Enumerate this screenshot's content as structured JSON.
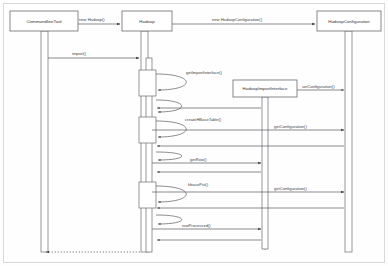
{
  "diagram": {
    "type": "uml-sequence-diagram",
    "canvas": {
      "width": 388,
      "height": 266,
      "background": "#fefefe"
    },
    "stroke_color": "#55555a",
    "text_color": "#3a3a3a"
  },
  "participants": [
    {
      "id": "cli",
      "label": "CommandlineTool",
      "box": {
        "x": 10,
        "y": 11,
        "w": 68,
        "h": 20
      },
      "lifeline_x": 44,
      "lifeline_bottom": 252
    },
    {
      "id": "hadoop",
      "label": "Hadoop",
      "box": {
        "x": 122,
        "y": 11,
        "w": 50,
        "h": 20
      },
      "lifeline_x": 147,
      "lifeline_bottom": 252
    },
    {
      "id": "hconf",
      "label": "HadoopConfiguration",
      "box": {
        "x": 317,
        "y": 11,
        "w": 64,
        "h": 20
      },
      "lifeline_x": 349,
      "lifeline_bottom": 252
    },
    {
      "id": "himport",
      "label": "HadoopImportInterface",
      "box": {
        "x": 233,
        "y": 80,
        "w": 64,
        "h": 17
      },
      "lifeline_x": 265,
      "lifeline_bottom": 252
    }
  ],
  "messages": [
    {
      "id": "m1",
      "label": "new Hadoop()",
      "from": "cli",
      "to": "hadoop",
      "y": 24,
      "kind": "create"
    },
    {
      "id": "m2",
      "label": "new HadoopConfiguration()",
      "from": "hadoop",
      "to": "hconf",
      "y": 24,
      "kind": "create"
    },
    {
      "id": "m3",
      "label": "import()",
      "from": "cli",
      "to": "hadoop",
      "y": 58,
      "kind": "call"
    },
    {
      "id": "m4",
      "label": "getImportInterface()",
      "from": "hadoop",
      "to": "hadoop",
      "y": 75,
      "kind": "self"
    },
    {
      "id": "m5",
      "label": "setConfiguration()",
      "from": "himport",
      "to": "hconf",
      "y": 90,
      "kind": "call"
    },
    {
      "id": "m6",
      "label": "createHBaseTable()",
      "from": "hadoop",
      "to": "hadoop",
      "y": 122,
      "kind": "self"
    },
    {
      "id": "m7",
      "label": "getConfiguration()",
      "from": "hadoop",
      "to": "hconf",
      "y": 130,
      "kind": "call"
    },
    {
      "id": "m8",
      "label": "getRow()",
      "from": "hadoop",
      "to": "himport",
      "y": 163,
      "kind": "call"
    },
    {
      "id": "m9",
      "label": "hbasePut()",
      "from": "hadoop",
      "to": "hadoop",
      "y": 187,
      "kind": "self"
    },
    {
      "id": "m10",
      "label": "getConfiguration()",
      "from": "hadoop",
      "to": "hconf",
      "y": 192,
      "kind": "call"
    },
    {
      "id": "m11",
      "label": "rowProcessed()",
      "from": "hadoop",
      "to": "himport",
      "y": 229,
      "kind": "call"
    },
    {
      "id": "m12",
      "label": "",
      "from": "hadoop",
      "to": "cli",
      "y": 252,
      "kind": "return-dashed"
    }
  ],
  "activations": [
    {
      "owner": "cli",
      "x": 41,
      "y": 31,
      "w": 6,
      "h": 221
    },
    {
      "owner": "hadoop",
      "x": 141,
      "y": 31,
      "w": 7,
      "h": 221
    },
    {
      "owner": "hadoop",
      "x": 144,
      "y": 60,
      "w": 6,
      "h": 192
    },
    {
      "owner": "hconf",
      "x": 345,
      "y": 31,
      "w": 7,
      "h": 221
    },
    {
      "owner": "himport",
      "x": 262,
      "y": 97,
      "w": 6,
      "h": 148
    },
    {
      "owner": "hadoop",
      "x": 147,
      "y": 70,
      "w": 9,
      "h": 26
    },
    {
      "owner": "hadoop",
      "x": 147,
      "y": 117,
      "w": 9,
      "h": 26
    },
    {
      "owner": "hadoop",
      "x": 147,
      "y": 182,
      "w": 9,
      "h": 26
    }
  ],
  "frame": {
    "x": 3,
    "y": 3,
    "w": 382,
    "h": 260
  }
}
